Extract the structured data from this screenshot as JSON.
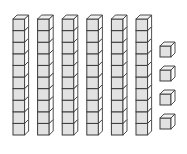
{
  "diagram": {
    "type": "base-ten-blocks",
    "tens_rods": 6,
    "cubes_per_rod": 10,
    "units": 4,
    "value_represented": 64,
    "colors": {
      "face": "#e2e2e2",
      "side": "#ffffff",
      "top": "#f0f0f0",
      "stroke": "#3a3a3a"
    },
    "rod_x": [
      13,
      37.6,
      62.2,
      86.8,
      111.4,
      136
    ],
    "rod_top_y": 19,
    "cube_size": 11.6,
    "depth": 4,
    "unit_x": 160,
    "unit_y": [
      46,
      70,
      94,
      118
    ],
    "unit_size": 11
  }
}
